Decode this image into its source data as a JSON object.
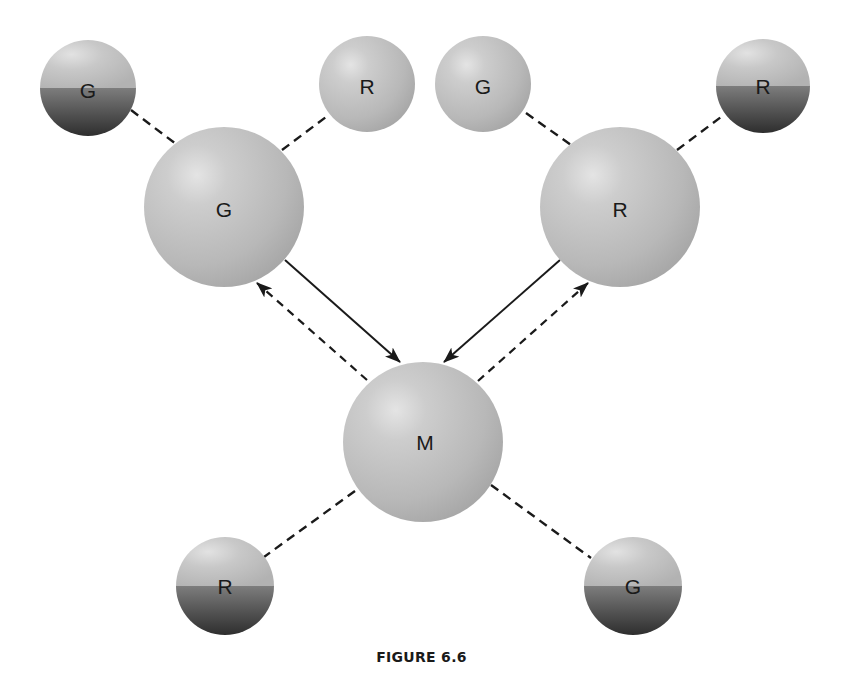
{
  "figure": {
    "caption": "FIGURE 6.6"
  },
  "colors": {
    "ball_light": "#cfcfcf",
    "ball_mid": "#b9b9b9",
    "ball_dark_top": "#7a7a7a",
    "ball_dark_bottom": "#2f2f2f",
    "line": "#1a1a1a",
    "background": "#ffffff"
  },
  "nodes": [
    {
      "id": "g-small-top-left",
      "label": "G",
      "size": "small",
      "style": "half-dark",
      "cx": 88,
      "cy": 88,
      "r": 48
    },
    {
      "id": "r-small-top-left",
      "label": "R",
      "size": "small",
      "style": "plain",
      "cx": 367,
      "cy": 84,
      "r": 48
    },
    {
      "id": "g-small-top-right",
      "label": "G",
      "size": "small",
      "style": "plain",
      "cx": 483,
      "cy": 84,
      "r": 48
    },
    {
      "id": "r-small-top-right",
      "label": "R",
      "size": "small",
      "style": "half-dark",
      "cx": 763,
      "cy": 86,
      "r": 47
    },
    {
      "id": "g-large",
      "label": "G",
      "size": "large",
      "style": "plain",
      "cx": 224,
      "cy": 207,
      "r": 80
    },
    {
      "id": "r-large",
      "label": "R",
      "size": "large",
      "style": "plain",
      "cx": 620,
      "cy": 207,
      "r": 80
    },
    {
      "id": "m-large",
      "label": "M",
      "size": "large",
      "style": "plain",
      "cx": 423,
      "cy": 442,
      "r": 80
    },
    {
      "id": "r-small-bottom-left",
      "label": "R",
      "size": "small",
      "style": "half-dark",
      "cx": 225,
      "cy": 586,
      "r": 49
    },
    {
      "id": "g-small-bottom-right",
      "label": "G",
      "size": "small",
      "style": "half-dark",
      "cx": 633,
      "cy": 586,
      "r": 49
    }
  ],
  "edges": [
    {
      "from": "g-small-top-left",
      "to": "g-large",
      "style": "dashed"
    },
    {
      "from": "r-small-top-left",
      "to": "g-large",
      "style": "dashed"
    },
    {
      "from": "g-small-top-right",
      "to": "r-large",
      "style": "dashed"
    },
    {
      "from": "r-small-top-right",
      "to": "r-large",
      "style": "dashed"
    },
    {
      "from": "g-large",
      "to": "m-large",
      "style": "solid-arrow"
    },
    {
      "from": "m-large",
      "to": "g-large",
      "style": "dashed-arrow"
    },
    {
      "from": "r-large",
      "to": "m-large",
      "style": "solid-arrow"
    },
    {
      "from": "m-large",
      "to": "r-large",
      "style": "dashed-arrow"
    },
    {
      "from": "m-large",
      "to": "r-small-bottom-left",
      "style": "dashed"
    },
    {
      "from": "m-large",
      "to": "g-small-bottom-right",
      "style": "dashed"
    }
  ]
}
